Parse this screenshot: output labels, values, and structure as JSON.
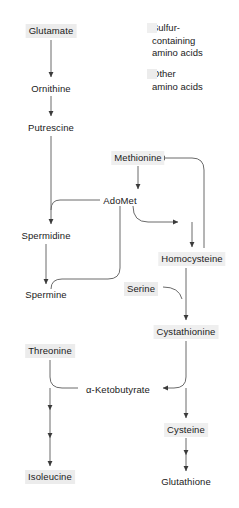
{
  "diagram": {
    "background_color": "#ffffff",
    "line_color": "#5a5a5a",
    "text_color": "#1a1a1a"
  },
  "legend": {
    "items": [
      {
        "key": "sulfur",
        "label": "Sulfur-\ncontaining\namino acids",
        "color": "#efefef"
      },
      {
        "key": "other",
        "label": "Other\namino acids",
        "color": "#ececec"
      }
    ]
  },
  "nodes": [
    {
      "id": "glutamate",
      "label": "Glutamate",
      "x": 51,
      "y": 30,
      "highlight": "other"
    },
    {
      "id": "ornithine",
      "label": "Ornithine",
      "x": 51,
      "y": 88,
      "highlight": "none"
    },
    {
      "id": "putrescine",
      "label": "Putrescine",
      "x": 51,
      "y": 127,
      "highlight": "none"
    },
    {
      "id": "methionine",
      "label": "Methionine",
      "x": 138,
      "y": 157,
      "highlight": "sulfur"
    },
    {
      "id": "adomet",
      "label": "AdoMet",
      "x": 120,
      "y": 200,
      "highlight": "none"
    },
    {
      "id": "spermidine",
      "label": "Spermidine",
      "x": 46,
      "y": 235,
      "highlight": "none"
    },
    {
      "id": "homocysteine",
      "label": "Homocysteine",
      "x": 192,
      "y": 258,
      "highlight": "sulfur"
    },
    {
      "id": "spermine",
      "label": "Spermine",
      "x": 46,
      "y": 294,
      "highlight": "none"
    },
    {
      "id": "serine",
      "label": "Serine",
      "x": 141,
      "y": 288,
      "highlight": "other"
    },
    {
      "id": "cystathionine",
      "label": "Cystathionine",
      "x": 186,
      "y": 331,
      "highlight": "sulfur"
    },
    {
      "id": "threonine",
      "label": "Threonine",
      "x": 50,
      "y": 350,
      "highlight": "other"
    },
    {
      "id": "ketobutyrate",
      "label": "α-Ketobutyrate",
      "x": 118,
      "y": 389,
      "highlight": "none"
    },
    {
      "id": "cysteine",
      "label": "Cysteine",
      "x": 186,
      "y": 429,
      "highlight": "sulfur"
    },
    {
      "id": "isoleucine",
      "label": "Isoleucine",
      "x": 50,
      "y": 476,
      "highlight": "other"
    },
    {
      "id": "glutathione",
      "label": "Glutathione",
      "x": 186,
      "y": 481,
      "highlight": "none"
    }
  ],
  "edges": [
    {
      "from": "glutamate",
      "to": "ornithine",
      "kind": "straight"
    },
    {
      "from": "ornithine",
      "to": "putrescine",
      "kind": "straight"
    },
    {
      "from": "putrescine",
      "to": "spermidine",
      "kind": "straight"
    },
    {
      "from": "methionine",
      "to": "adomet",
      "kind": "straight"
    },
    {
      "from": "adomet",
      "to": "spermidine",
      "kind": "curved"
    },
    {
      "from": "adomet",
      "to": "homocysteine",
      "kind": "curved"
    },
    {
      "from": "spermidine",
      "to": "spermine",
      "kind": "straight"
    },
    {
      "from": "adomet",
      "to": "spermine",
      "kind": "curved"
    },
    {
      "from": "homocysteine",
      "to": "methionine",
      "kind": "recycle"
    },
    {
      "from": "serine",
      "to": "cystathionine",
      "kind": "curved"
    },
    {
      "from": "homocysteine",
      "to": "cystathionine",
      "kind": "straight"
    },
    {
      "from": "cystathionine",
      "to": "ketobutyrate",
      "kind": "curved"
    },
    {
      "from": "cystathionine",
      "to": "cysteine",
      "kind": "straight"
    },
    {
      "from": "threonine",
      "to": "ketobutyrate",
      "kind": "curved"
    },
    {
      "from": "ketobutyrate",
      "to": "isoleucine",
      "kind": "multi-step"
    },
    {
      "from": "cysteine",
      "to": "glutathione",
      "kind": "multi-step"
    }
  ]
}
